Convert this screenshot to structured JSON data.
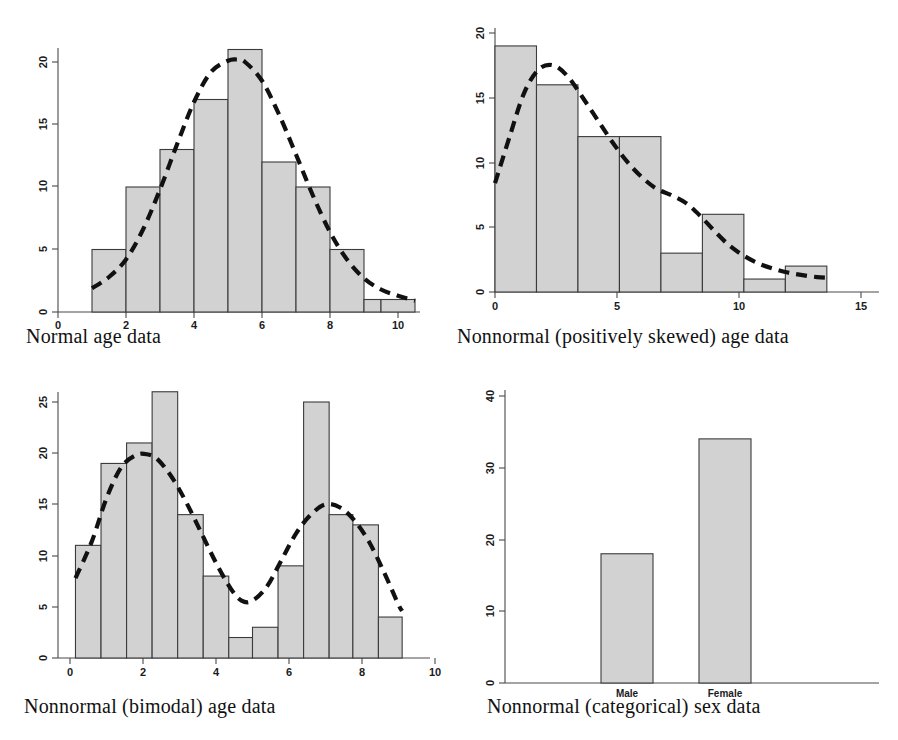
{
  "figure": {
    "panels": [
      {
        "id": "normal-age",
        "caption": "Normal age data"
      },
      {
        "id": "skewed-age",
        "caption": "Nonnormal (positively skewed) age data"
      },
      {
        "id": "bimodal-age",
        "caption": "Nonnormal (bimodal) age data"
      },
      {
        "id": "categorical-sex",
        "caption": "Nonnormal (categorical) sex data"
      }
    ]
  },
  "chart_data": [
    {
      "type": "bar",
      "title": "Normal age data",
      "xlabel": "",
      "ylabel": "",
      "xlim": [
        -0.45,
        11.0
      ],
      "ylim": [
        0,
        21.8
      ],
      "xticks": [
        0,
        2,
        4,
        6,
        8,
        10
      ],
      "xtick_labels": [
        "0",
        "2",
        "4",
        "6",
        "8",
        "10"
      ],
      "yticks": [
        0,
        5,
        10,
        15,
        20
      ],
      "ytick_labels": [
        "0",
        "5",
        "10",
        "15",
        "20"
      ],
      "grid": false,
      "legend": "none",
      "bin_edges": [
        1,
        2,
        3,
        4,
        5,
        6,
        7,
        8,
        9,
        9.5,
        10.5
      ],
      "values": [
        5,
        10,
        13,
        17,
        21,
        12,
        10,
        5,
        1,
        1
      ],
      "overlay": {
        "name": "normal density curve",
        "style": "dashed",
        "x": [
          1.0,
          1.5,
          2.0,
          2.5,
          3.0,
          3.5,
          4.0,
          4.5,
          5.0,
          5.25,
          5.5,
          6.0,
          6.5,
          7.0,
          7.5,
          8.0,
          8.5,
          9.0,
          9.5,
          10.0,
          10.5
        ],
        "y": [
          1.9,
          2.8,
          4.2,
          6.6,
          9.8,
          13.4,
          16.8,
          19.2,
          20.1,
          20.2,
          20.0,
          18.5,
          15.8,
          12.6,
          9.3,
          6.4,
          4.2,
          2.7,
          1.8,
          1.3,
          0.9
        ]
      }
    },
    {
      "type": "bar",
      "title": "Nonnormal (positively skewed) age data",
      "xlabel": "",
      "ylabel": "",
      "xlim": [
        -0.9,
        16.3
      ],
      "ylim": [
        0,
        21.0
      ],
      "xticks": [
        0,
        5,
        10,
        15
      ],
      "xtick_labels": [
        "0",
        "5",
        "10",
        "15"
      ],
      "yticks": [
        0,
        5,
        10,
        15,
        20
      ],
      "ytick_labels": [
        "0",
        "5",
        "10",
        "15",
        "20"
      ],
      "grid": false,
      "legend": "none",
      "bin_edges": [
        0,
        1.7,
        3.4,
        5.1,
        6.8,
        8.5,
        10.2,
        11.9,
        13.6
      ],
      "values": [
        19,
        16,
        12,
        12,
        3,
        6,
        1,
        2
      ],
      "overlay": {
        "name": "smoothed density curve",
        "style": "dashed",
        "x": [
          0.0,
          0.6,
          1.2,
          1.8,
          2.4,
          3.0,
          3.6,
          4.2,
          4.8,
          5.4,
          6.0,
          6.6,
          7.2,
          7.8,
          8.4,
          9.0,
          9.6,
          10.2,
          10.8,
          11.4,
          12.0,
          12.6,
          13.2,
          13.6
        ],
        "y": [
          8.4,
          12.0,
          15.4,
          17.2,
          17.5,
          16.6,
          15.0,
          13.3,
          11.6,
          10.1,
          8.9,
          8.0,
          7.5,
          6.9,
          5.9,
          4.7,
          3.6,
          2.8,
          2.2,
          1.8,
          1.5,
          1.3,
          1.15,
          1.1
        ]
      }
    },
    {
      "type": "bar",
      "title": "Nonnormal (bimodal) age data",
      "xlabel": "",
      "ylabel": "",
      "xlim": [
        -0.55,
        10.3
      ],
      "ylim": [
        0,
        27.0
      ],
      "xticks": [
        0,
        2,
        4,
        6,
        8,
        10
      ],
      "xtick_labels": [
        "0",
        "2",
        "4",
        "6",
        "8",
        "10"
      ],
      "yticks": [
        0,
        5,
        10,
        15,
        20,
        25
      ],
      "ytick_labels": [
        "0",
        "5",
        "10",
        "15",
        "20",
        "25"
      ],
      "grid": false,
      "legend": "none",
      "bin_edges": [
        0.15,
        0.85,
        1.55,
        2.25,
        2.95,
        3.65,
        4.35,
        5.0,
        5.7,
        6.4,
        7.1,
        7.75,
        8.45,
        9.1
      ],
      "values": [
        11,
        19,
        21,
        26,
        14,
        8,
        2,
        3,
        9,
        25,
        14,
        13,
        4
      ],
      "overlay": {
        "name": "bimodal density curve",
        "style": "dashed",
        "x": [
          0.15,
          0.6,
          1.0,
          1.4,
          1.8,
          2.1,
          2.4,
          2.8,
          3.2,
          3.6,
          4.0,
          4.4,
          4.7,
          5.0,
          5.4,
          5.8,
          6.2,
          6.6,
          7.0,
          7.4,
          7.8,
          8.2,
          8.6,
          9.0,
          9.1
        ],
        "y": [
          7.8,
          11.4,
          15.6,
          18.6,
          19.8,
          19.9,
          19.4,
          17.6,
          15.1,
          12.2,
          9.3,
          6.8,
          5.6,
          5.6,
          7.0,
          9.6,
          12.2,
          14.0,
          15.0,
          14.7,
          13.4,
          11.3,
          8.4,
          5.2,
          4.6
        ]
      }
    },
    {
      "type": "bar",
      "title": "Nonnormal (categorical) sex data",
      "xlabel": "",
      "ylabel": "",
      "categories": [
        "Male",
        "Female"
      ],
      "values": [
        18,
        34
      ],
      "ylim": [
        0,
        41
      ],
      "yticks": [
        0,
        10,
        20,
        30,
        40
      ],
      "ytick_labels": [
        "0",
        "10",
        "20",
        "30",
        "40"
      ],
      "grid": false,
      "legend": "none",
      "overlay": null
    }
  ],
  "colors": {
    "bar_fill": "#d2d2d2",
    "bar_stroke": "#3b3b3b",
    "curve": "#111111",
    "axis": "#4a4a4a",
    "text": "#1b1b1b",
    "background": "#ffffff"
  }
}
